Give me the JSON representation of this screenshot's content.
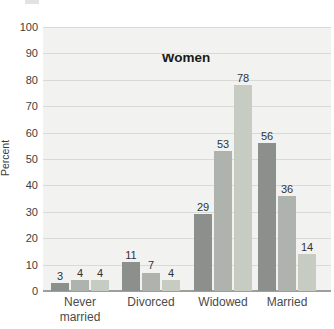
{
  "chart_data": {
    "type": "bar",
    "title": "Women",
    "ylabel": "Percent",
    "categories": [
      "Never married",
      "Divorced",
      "Widowed",
      "Married"
    ],
    "series": [
      {
        "name": "series-1",
        "color": "#8b908c",
        "values": [
          3,
          11,
          29,
          56
        ]
      },
      {
        "name": "series-2",
        "color": "#aeb3ad",
        "values": [
          4,
          7,
          53,
          36
        ]
      },
      {
        "name": "series-3",
        "color": "#c7ccc2",
        "values": [
          4,
          4,
          78,
          14
        ]
      }
    ],
    "y_ticks": [
      0,
      10,
      20,
      30,
      40,
      50,
      60,
      70,
      80,
      90,
      100
    ],
    "ylim": [
      0,
      100
    ],
    "grid": true,
    "legend_position": "cut-off-at-top"
  },
  "colors": {
    "plot_background": "#f2f2f0",
    "gridline": "#d9d9d6",
    "baseline": "#9e9e9b",
    "page_background": "#ffffff"
  }
}
